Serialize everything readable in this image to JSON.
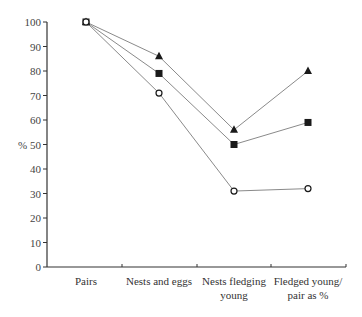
{
  "chart_data": {
    "type": "line",
    "title": "",
    "xlabel": "",
    "ylabel": "%",
    "ylim": [
      0,
      100
    ],
    "yticks": [
      0,
      10,
      20,
      30,
      40,
      50,
      60,
      70,
      80,
      90,
      100
    ],
    "categories": [
      [
        "Pairs"
      ],
      [
        "Nests and eggs"
      ],
      [
        "Nests fledging",
        "young"
      ],
      [
        "Fledged young/",
        "pair as %"
      ]
    ],
    "grid": false,
    "legend": null,
    "series": [
      {
        "name": "triangle",
        "marker": "filled-triangle",
        "values": [
          100,
          86,
          56,
          80
        ]
      },
      {
        "name": "square",
        "marker": "filled-square",
        "values": [
          100,
          79,
          50,
          59
        ]
      },
      {
        "name": "circle",
        "marker": "open-circle",
        "values": [
          100,
          71,
          31,
          32
        ]
      }
    ]
  },
  "colors": {
    "line": "#8a8a8a",
    "marker": "#1a1a1a",
    "axis": "#333333"
  }
}
